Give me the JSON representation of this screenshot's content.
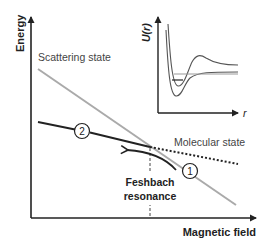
{
  "diagram": {
    "axes": {
      "y_label": "Energy",
      "x_label": "Magnetic field"
    },
    "curves": {
      "scattering_state": {
        "label": "Scattering state",
        "color": "#aaaaaa"
      },
      "molecular_state": {
        "label": "Molecular state",
        "color": "#222222"
      }
    },
    "resonance": {
      "line1": "Feshbach",
      "line2": "resonance"
    },
    "markers": [
      {
        "id": "1",
        "label": "1"
      },
      {
        "id": "2",
        "label": "2"
      }
    ],
    "inset": {
      "y_label": "U(r)",
      "x_label": "r"
    }
  }
}
